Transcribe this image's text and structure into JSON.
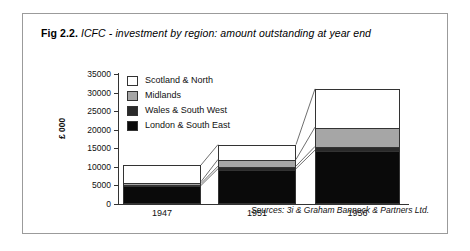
{
  "figure": {
    "label": "Fig 2.2.",
    "caption": "ICFC - investment by region: amount outstanding at year end",
    "sources": "Sources: 3i & Graham Bannock & Partners Ltd."
  },
  "chart_data": {
    "type": "bar",
    "stacked": true,
    "title": "ICFC - investment by region: amount outstanding at year end",
    "xlabel": "",
    "ylabel": "£ 000",
    "categories": [
      "1947",
      "1951",
      "1956"
    ],
    "ylim": [
      0,
      35000
    ],
    "yticks": [
      0,
      5000,
      10000,
      15000,
      20000,
      25000,
      30000,
      35000
    ],
    "ytick_labels": [
      "0",
      "5000",
      "10000",
      "15000",
      "20000",
      "25000",
      "30000",
      "35000"
    ],
    "grid": false,
    "legend_position": "upper-left-inside",
    "series": [
      {
        "name": "London & South East",
        "color": "#0a0a0a",
        "values": [
          5000,
          9500,
          14500
        ]
      },
      {
        "name": "Wales & South West",
        "color": "#2a2a2a",
        "values": [
          500,
          700,
          1000
        ]
      },
      {
        "name": "Midlands",
        "color": "#a6a6a6",
        "values": [
          500,
          1800,
          5200
        ]
      },
      {
        "name": "Scotland & North",
        "color": "#ffffff",
        "values": [
          4500,
          4000,
          10300
        ]
      }
    ],
    "totals": [
      10500,
      16000,
      31000
    ]
  },
  "legend": {
    "items": [
      {
        "label": "Scotland & North",
        "color": "#ffffff"
      },
      {
        "label": "Midlands",
        "color": "#a6a6a6"
      },
      {
        "label": "Wales & South West",
        "color": "#2a2a2a"
      },
      {
        "label": "London & South East",
        "color": "#0a0a0a"
      }
    ]
  }
}
